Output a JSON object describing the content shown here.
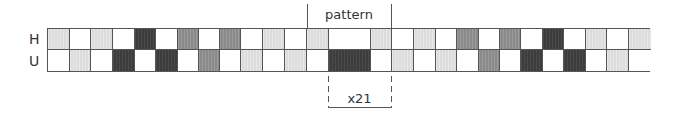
{
  "rows": [
    {
      "label": "H",
      "key": "H"
    },
    {
      "label": "U",
      "key": "U"
    }
  ],
  "legend_colors": {
    "W": "#ffffff",
    "L": "#dcdcdc",
    "M": "#8a8a8a",
    "D": "#3c3c3c"
  },
  "cells": [
    {
      "x": 0,
      "w": 22,
      "H": "L",
      "U": "W"
    },
    {
      "x": 22,
      "w": 21,
      "H": "W",
      "U": "L"
    },
    {
      "x": 43,
      "w": 22,
      "H": "L",
      "U": "W"
    },
    {
      "x": 65,
      "w": 22,
      "H": "W",
      "U": "D"
    },
    {
      "x": 87,
      "w": 21,
      "H": "D",
      "U": "W"
    },
    {
      "x": 108,
      "w": 22,
      "H": "W",
      "U": "D"
    },
    {
      "x": 130,
      "w": 21,
      "H": "M",
      "U": "W"
    },
    {
      "x": 151,
      "w": 21,
      "H": "W",
      "U": "M"
    },
    {
      "x": 172,
      "w": 21,
      "H": "M",
      "U": "W"
    },
    {
      "x": 193,
      "w": 22,
      "H": "W",
      "U": "L"
    },
    {
      "x": 215,
      "w": 22,
      "H": "L",
      "U": "W"
    },
    {
      "x": 237,
      "w": 22,
      "H": "W",
      "U": "L"
    },
    {
      "x": 259,
      "w": 22,
      "H": "L",
      "U": "W"
    },
    {
      "x": 281,
      "w": 42,
      "H": "W",
      "U": "D"
    },
    {
      "x": 323,
      "w": 21,
      "H": "L",
      "U": "W"
    },
    {
      "x": 344,
      "w": 22,
      "H": "W",
      "U": "L"
    },
    {
      "x": 366,
      "w": 22,
      "H": "L",
      "U": "W"
    },
    {
      "x": 388,
      "w": 21,
      "H": "W",
      "U": "L"
    },
    {
      "x": 409,
      "w": 22,
      "H": "M",
      "U": "W"
    },
    {
      "x": 431,
      "w": 21,
      "H": "W",
      "U": "M"
    },
    {
      "x": 452,
      "w": 21,
      "H": "M",
      "U": "W"
    },
    {
      "x": 473,
      "w": 22,
      "H": "W",
      "U": "D"
    },
    {
      "x": 495,
      "w": 21,
      "H": "D",
      "U": "W"
    },
    {
      "x": 516,
      "w": 22,
      "H": "W",
      "U": "D"
    },
    {
      "x": 538,
      "w": 21,
      "H": "L",
      "U": "W"
    },
    {
      "x": 559,
      "w": 22,
      "H": "W",
      "U": "L"
    },
    {
      "x": 581,
      "w": 22,
      "H": "L",
      "U": "W"
    }
  ],
  "pattern": {
    "label": "pattern",
    "left_x": 307,
    "right_x": 391
  },
  "repeat": {
    "label": "x21",
    "left_x": 328,
    "right_x": 391
  }
}
